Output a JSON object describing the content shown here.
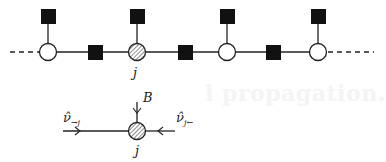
{
  "diagram": {
    "type": "factor-graph",
    "top_chain": {
      "variable_nodes": [
        {
          "id": "v1",
          "style": "open"
        },
        {
          "id": "j",
          "style": "hatched",
          "label": "j"
        },
        {
          "id": "v3",
          "style": "open"
        },
        {
          "id": "v4",
          "style": "open"
        }
      ],
      "pairwise_factors": 3,
      "unary_factors": 4,
      "continues_left": true,
      "continues_right": true
    },
    "bottom_detail": {
      "node_label": "j",
      "incoming_messages": [
        {
          "from": "left",
          "label_base": "ν̂",
          "label_sub": "→j"
        },
        {
          "from": "right",
          "label_base": "ν̂",
          "label_sub": "j←"
        },
        {
          "from": "top",
          "label_base": "B",
          "label_sub": ""
        }
      ]
    }
  },
  "background_text": "l propagation."
}
